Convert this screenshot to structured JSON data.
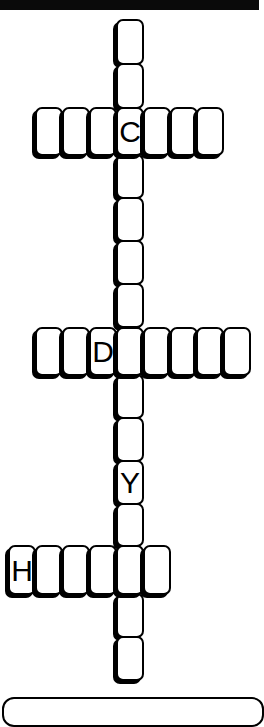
{
  "puzzle": {
    "cell_size": {
      "w": 27,
      "h": 43
    },
    "across_row_height": 49,
    "colors": {
      "ink": "#000000",
      "paper": "#ffffff",
      "top_bar": "#0a0a0a"
    },
    "cells": [
      {
        "id": "v1",
        "x": 116,
        "y": 19,
        "w": 28,
        "h": 46,
        "letter": ""
      },
      {
        "id": "v2",
        "x": 116,
        "y": 63,
        "w": 28,
        "h": 46,
        "letter": ""
      },
      {
        "id": "c1",
        "x": 35,
        "y": 107,
        "w": 28,
        "h": 49,
        "letter": ""
      },
      {
        "id": "c2",
        "x": 62,
        "y": 107,
        "w": 28,
        "h": 49,
        "letter": ""
      },
      {
        "id": "c3",
        "x": 89,
        "y": 107,
        "w": 28,
        "h": 49,
        "letter": ""
      },
      {
        "id": "c4",
        "x": 116,
        "y": 107,
        "w": 28,
        "h": 49,
        "letter": "C"
      },
      {
        "id": "c5",
        "x": 143,
        "y": 107,
        "w": 28,
        "h": 49,
        "letter": ""
      },
      {
        "id": "c6",
        "x": 170,
        "y": 107,
        "w": 28,
        "h": 49,
        "letter": ""
      },
      {
        "id": "c7",
        "x": 196,
        "y": 107,
        "w": 28,
        "h": 49,
        "letter": ""
      },
      {
        "id": "v3",
        "x": 116,
        "y": 154,
        "w": 28,
        "h": 45,
        "letter": ""
      },
      {
        "id": "v4",
        "x": 116,
        "y": 197,
        "w": 28,
        "h": 45,
        "letter": ""
      },
      {
        "id": "v5",
        "x": 116,
        "y": 240,
        "w": 28,
        "h": 45,
        "letter": ""
      },
      {
        "id": "v6",
        "x": 116,
        "y": 283,
        "w": 28,
        "h": 45,
        "letter": ""
      },
      {
        "id": "d1",
        "x": 35,
        "y": 327,
        "w": 28,
        "h": 49,
        "letter": ""
      },
      {
        "id": "d2",
        "x": 62,
        "y": 327,
        "w": 28,
        "h": 49,
        "letter": ""
      },
      {
        "id": "d3",
        "x": 89,
        "y": 327,
        "w": 28,
        "h": 49,
        "letter": "D"
      },
      {
        "id": "d4",
        "x": 116,
        "y": 327,
        "w": 28,
        "h": 49,
        "letter": ""
      },
      {
        "id": "d5",
        "x": 143,
        "y": 327,
        "w": 28,
        "h": 49,
        "letter": ""
      },
      {
        "id": "d6",
        "x": 170,
        "y": 327,
        "w": 28,
        "h": 49,
        "letter": ""
      },
      {
        "id": "d7",
        "x": 196,
        "y": 327,
        "w": 28,
        "h": 49,
        "letter": ""
      },
      {
        "id": "d8",
        "x": 223,
        "y": 327,
        "w": 28,
        "h": 49,
        "letter": ""
      },
      {
        "id": "v7",
        "x": 116,
        "y": 374,
        "w": 28,
        "h": 45,
        "letter": ""
      },
      {
        "id": "v8",
        "x": 116,
        "y": 417,
        "w": 28,
        "h": 45,
        "letter": ""
      },
      {
        "id": "v9",
        "x": 116,
        "y": 460,
        "w": 28,
        "h": 45,
        "letter": "Y"
      },
      {
        "id": "v10",
        "x": 116,
        "y": 503,
        "w": 28,
        "h": 44,
        "letter": ""
      },
      {
        "id": "h1",
        "x": 8,
        "y": 545,
        "w": 28,
        "h": 50,
        "letter": "H"
      },
      {
        "id": "h2",
        "x": 35,
        "y": 545,
        "w": 28,
        "h": 50,
        "letter": ""
      },
      {
        "id": "h3",
        "x": 62,
        "y": 545,
        "w": 28,
        "h": 50,
        "letter": ""
      },
      {
        "id": "h4",
        "x": 89,
        "y": 545,
        "w": 28,
        "h": 50,
        "letter": ""
      },
      {
        "id": "h5",
        "x": 116,
        "y": 545,
        "w": 28,
        "h": 50,
        "letter": ""
      },
      {
        "id": "h6",
        "x": 143,
        "y": 545,
        "w": 28,
        "h": 50,
        "letter": ""
      },
      {
        "id": "v11",
        "x": 116,
        "y": 593,
        "w": 28,
        "h": 45,
        "letter": ""
      },
      {
        "id": "v12",
        "x": 116,
        "y": 636,
        "w": 28,
        "h": 45,
        "letter": ""
      }
    ]
  }
}
